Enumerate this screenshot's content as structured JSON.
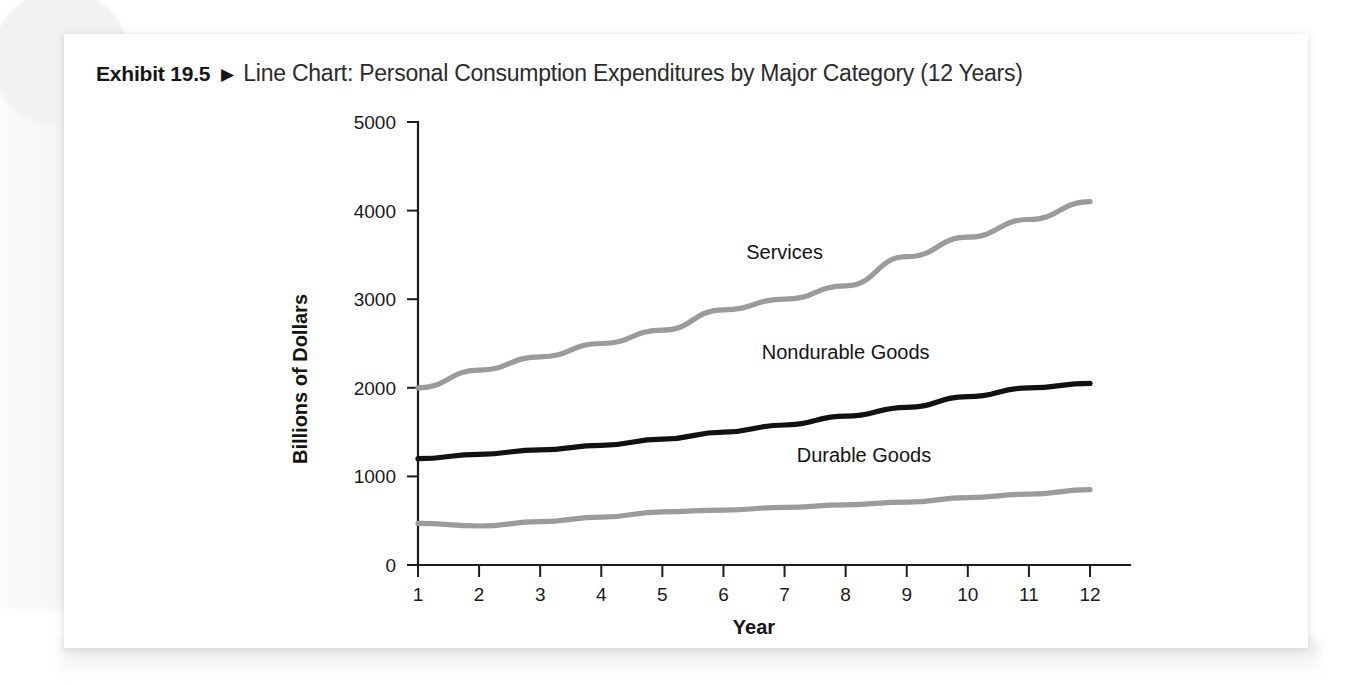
{
  "exhibit": {
    "number_label": "Exhibit 19.5",
    "separator_icon": "triangle-right-icon",
    "separator_glyph": "▶",
    "title": "Line Chart: Personal Consumption Expenditures by Major Category (12 Years)"
  },
  "colors": {
    "card_background": "#ffffff",
    "page_background": "#ffffff",
    "axis": "#1c1c1c",
    "services_line": "#9b9b9b",
    "nondurable_line": "#111111",
    "durable_line": "#9b9b9b",
    "title_text": "#2b2b2b"
  },
  "chart_data": {
    "type": "line",
    "title": "Line Chart: Personal Consumption Expenditures by Major Category (12 Years)",
    "xlabel": "Year",
    "ylabel": "Billions of Dollars",
    "x": [
      1,
      2,
      3,
      4,
      5,
      6,
      7,
      8,
      9,
      10,
      11,
      12
    ],
    "xticklabels": [
      "1",
      "2",
      "3",
      "4",
      "5",
      "6",
      "7",
      "8",
      "9",
      "10",
      "11",
      "12"
    ],
    "yticks": [
      0,
      1000,
      2000,
      3000,
      4000,
      5000
    ],
    "yticklabels": [
      "0",
      "1000",
      "2000",
      "3000",
      "4000",
      "5000"
    ],
    "xlim": [
      1,
      12
    ],
    "ylim": [
      0,
      5000
    ],
    "grid": false,
    "legend_position": "inline-labels",
    "series": [
      {
        "name": "Services",
        "color": "#9b9b9b",
        "label_text": "Services",
        "values": [
          2000,
          2200,
          2350,
          2500,
          2650,
          2880,
          3000,
          3150,
          3480,
          3700,
          3900,
          4100
        ]
      },
      {
        "name": "Nondurable Goods",
        "color": "#111111",
        "label_text": "Nondurable Goods",
        "values": [
          1200,
          1250,
          1300,
          1350,
          1420,
          1500,
          1580,
          1680,
          1780,
          1900,
          2000,
          2050
        ]
      },
      {
        "name": "Durable Goods",
        "color": "#9b9b9b",
        "label_text": "Durable Goods",
        "values": [
          470,
          440,
          490,
          540,
          600,
          620,
          650,
          680,
          710,
          760,
          800,
          850
        ]
      }
    ],
    "annotations": [
      {
        "text": "Services",
        "x": 7.0,
        "y": 3450
      },
      {
        "text": "Nondurable Goods",
        "x": 8.0,
        "y": 2320
      },
      {
        "text": "Durable Goods",
        "x": 8.3,
        "y": 1160
      }
    ]
  }
}
